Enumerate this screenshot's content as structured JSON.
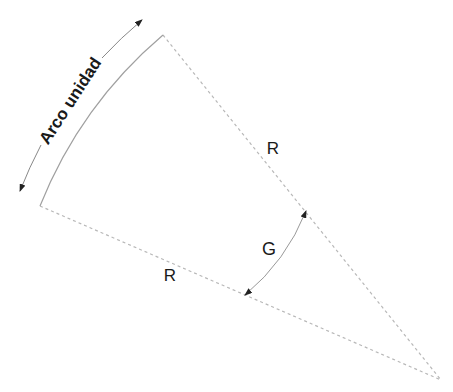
{
  "diagram": {
    "title": "",
    "labels": {
      "arc_label": "Arco unidad",
      "radius_upper": "R",
      "radius_lower": "R",
      "angle": "G"
    },
    "colors": {
      "background": "#ffffff",
      "radius_line": "#b8b8b8",
      "arc_line": "#a0a0a0",
      "dimension_line": "#888888",
      "arrowhead": "#222222",
      "text": "#1a1a1a"
    },
    "elements": [
      {
        "name": "sector",
        "description": "Circular sector with two dashed radii and a solid arc"
      },
      {
        "name": "arc-dimension",
        "description": "Dimension arc with arrowheads labeled Arco unidad"
      },
      {
        "name": "angle-dimension",
        "description": "Angle arc with arrowheads labeled G"
      }
    ]
  }
}
